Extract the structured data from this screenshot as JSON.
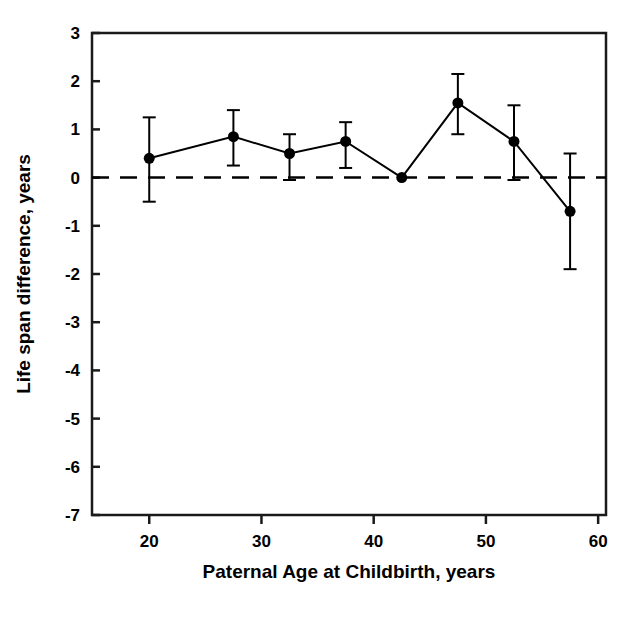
{
  "chart_data": {
    "type": "line",
    "title": "",
    "subtitle": "",
    "xlabel": "Paternal Age at Childbirth, years",
    "ylabel": "Life span difference, years",
    "xlim": [
      14.9,
      60.7
    ],
    "ylim": [
      -7,
      3
    ],
    "xticks": [
      20,
      30,
      40,
      50,
      60
    ],
    "xtick_labels": [
      "20",
      "30",
      "40",
      "50",
      "60"
    ],
    "yticks": [
      3,
      2,
      1,
      0,
      -1,
      -2,
      -3,
      -4,
      -5,
      -6,
      -7
    ],
    "ytick_labels": [
      "3",
      "2",
      "1",
      "0",
      "-1",
      "-2",
      "-3",
      "-4",
      "-5",
      "-6",
      "-7"
    ],
    "grid": false,
    "legend": null,
    "legend_position": "none",
    "reference_lines": [
      {
        "name": "zero-line",
        "axis": "y",
        "value": 0,
        "style": "dashed",
        "color": "#000000"
      }
    ],
    "marker": {
      "shape": "circle",
      "color": "#000000",
      "size": 11
    },
    "line": {
      "color": "#000000",
      "width": 2,
      "style": "solid"
    },
    "errorbar": {
      "color": "#000000",
      "capwidth": 13,
      "width": 2
    },
    "x": [
      20.0,
      27.5,
      32.5,
      37.5,
      42.5,
      47.5,
      52.5,
      57.5
    ],
    "values": [
      0.4,
      0.85,
      0.5,
      0.75,
      0.0,
      1.55,
      0.75,
      -0.7
    ],
    "error_low": [
      -0.5,
      0.25,
      -0.05,
      0.2,
      0.0,
      0.9,
      -0.05,
      -1.9
    ],
    "error_high": [
      1.25,
      1.4,
      0.9,
      1.15,
      0.0,
      2.15,
      1.5,
      0.5
    ],
    "points": [
      {
        "x": 20.0,
        "y": 0.4,
        "lo": -0.5,
        "hi": 1.25
      },
      {
        "x": 27.5,
        "y": 0.85,
        "lo": 0.25,
        "hi": 1.4
      },
      {
        "x": 32.5,
        "y": 0.5,
        "lo": -0.05,
        "hi": 0.9
      },
      {
        "x": 37.5,
        "y": 0.75,
        "lo": 0.2,
        "hi": 1.15
      },
      {
        "x": 42.5,
        "y": 0.0,
        "lo": 0.0,
        "hi": 0.0
      },
      {
        "x": 47.5,
        "y": 1.55,
        "lo": 0.9,
        "hi": 2.15
      },
      {
        "x": 52.5,
        "y": 0.75,
        "lo": -0.05,
        "hi": 1.5
      },
      {
        "x": 57.5,
        "y": -0.7,
        "lo": -1.9,
        "hi": 0.5
      }
    ]
  },
  "colors": {
    "background": "#ffffff",
    "foreground": "#000000",
    "axis": "#1a1a1a"
  }
}
